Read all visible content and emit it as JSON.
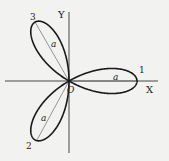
{
  "figure": {
    "axes": {
      "x_label": "X",
      "y_label": "Y",
      "origin_label": "O"
    },
    "petals": [
      {
        "number": "1",
        "radius_label": "a",
        "angle_deg": 0
      },
      {
        "number": "2",
        "radius_label": "a",
        "angle_deg": 240
      },
      {
        "number": "3",
        "radius_label": "a",
        "angle_deg": 120
      }
    ],
    "colors": {
      "background": "#f2f2f0",
      "curve": "#1a1a1a",
      "axes": "#333333"
    }
  }
}
